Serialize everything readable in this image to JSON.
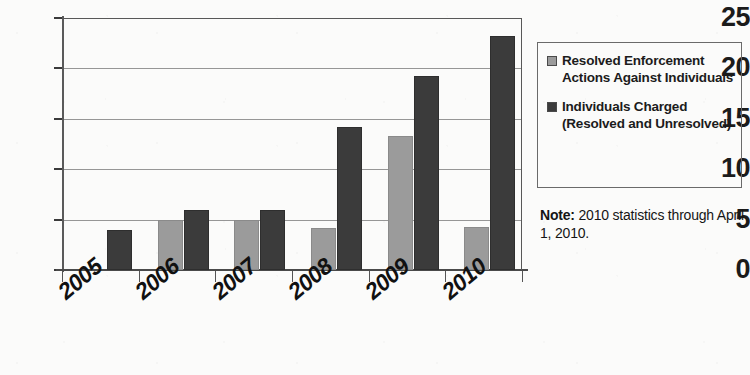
{
  "chart_data": {
    "type": "bar",
    "title": "",
    "subtitle": "",
    "xlabel": "",
    "ylabel": "",
    "categories": [
      "2005",
      "2006",
      "2007",
      "2008",
      "2009",
      "2010"
    ],
    "series": [
      {
        "name": "Resolved Enforcement Actions Against Individuals",
        "color": "#9b9b9b",
        "values": [
          null,
          5,
          5,
          4.2,
          13.3,
          4.3
        ]
      },
      {
        "name": "Individuals Charged (Resolved and Unresolved)",
        "color": "#3b3b3b",
        "values": [
          4,
          6,
          6,
          14.2,
          19.2,
          23.2
        ]
      }
    ],
    "ylim": [
      0,
      25
    ],
    "ytick_labels": [
      "0",
      "5",
      "10",
      "15",
      "20",
      "25"
    ],
    "ytick_values": [
      0,
      5,
      10,
      15,
      20,
      25
    ],
    "grid": true,
    "legend_position": "right",
    "annotations": [
      {
        "label": "Note:",
        "text": " 2010 statistics through April 1, 2010."
      }
    ]
  },
  "legend": {
    "entries": [
      {
        "label": "Resolved Enforcement Actions Against Individuals",
        "swatch": "light-gray-swatch"
      },
      {
        "label": "Individuals Charged (Resolved and Unresolved)",
        "swatch": "dark-gray-swatch"
      }
    ]
  },
  "note": {
    "label": "Note:",
    "text": " 2010 statistics through April 1, 2010."
  }
}
